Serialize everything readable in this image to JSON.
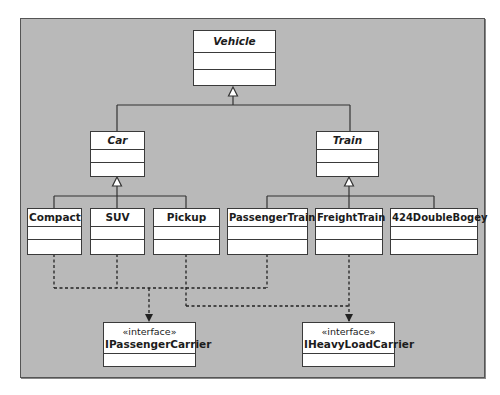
{
  "diagram": {
    "type": "UML class diagram",
    "colors": {
      "background": "#b9b9b9",
      "box_fill": "#ffffff",
      "line": "#333333"
    },
    "classes": {
      "vehicle": {
        "name": "Vehicle",
        "abstract": true
      },
      "car": {
        "name": "Car",
        "abstract": true
      },
      "train": {
        "name": "Train",
        "abstract": true
      },
      "compact": {
        "name": "Compact"
      },
      "suv": {
        "name": "SUV"
      },
      "pickup": {
        "name": "Pickup"
      },
      "passenger_train": {
        "name": "PassengerTrain"
      },
      "freight_train": {
        "name": "FreightTrain"
      },
      "double_bogey": {
        "name": "424DoubleBogey"
      }
    },
    "interfaces": {
      "passenger_carrier": {
        "stereotype": "«interface»",
        "name": "IPassengerCarrier"
      },
      "heavy_load_carrier": {
        "stereotype": "«interface»",
        "name": "IHeavyLoadCarrier"
      }
    },
    "relationships": [
      {
        "type": "generalization",
        "from": "Car",
        "to": "Vehicle"
      },
      {
        "type": "generalization",
        "from": "Train",
        "to": "Vehicle"
      },
      {
        "type": "generalization",
        "from": "Compact",
        "to": "Car"
      },
      {
        "type": "generalization",
        "from": "SUV",
        "to": "Car"
      },
      {
        "type": "generalization",
        "from": "Pickup",
        "to": "Car"
      },
      {
        "type": "generalization",
        "from": "PassengerTrain",
        "to": "Train"
      },
      {
        "type": "generalization",
        "from": "FreightTrain",
        "to": "Train"
      },
      {
        "type": "generalization",
        "from": "424DoubleBogey",
        "to": "Train"
      },
      {
        "type": "dependency",
        "from": "Compact",
        "to": "IPassengerCarrier"
      },
      {
        "type": "dependency",
        "from": "SUV",
        "to": "IPassengerCarrier"
      },
      {
        "type": "dependency",
        "from": "PassengerTrain",
        "to": "IPassengerCarrier"
      },
      {
        "type": "dependency",
        "from": "Pickup",
        "to": "IHeavyLoadCarrier"
      },
      {
        "type": "dependency",
        "from": "FreightTrain",
        "to": "IHeavyLoadCarrier"
      }
    ]
  }
}
